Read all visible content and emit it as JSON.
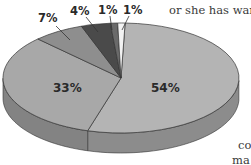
{
  "chart_data": {
    "type": "pie",
    "style": "3d",
    "title": "",
    "categories": [
      "Slice A",
      "Slice B",
      "Slice C",
      "Slice D",
      "Slice E",
      "Slice F"
    ],
    "values": [
      54,
      33,
      7,
      4,
      1,
      1
    ],
    "labels": [
      "54%",
      "33%",
      "7%",
      "4%",
      "1%",
      "1%"
    ],
    "colors": [
      "#b4b4b4",
      "#a8a8a8",
      "#8e8e8e",
      "#4a4a4a",
      "#6a6a6a",
      "#f2f2f2"
    ],
    "legend": "none"
  },
  "surrounding_text": {
    "top_right": "or she has war",
    "bottom_right_1": "co",
    "bottom_right_2": "ma"
  }
}
